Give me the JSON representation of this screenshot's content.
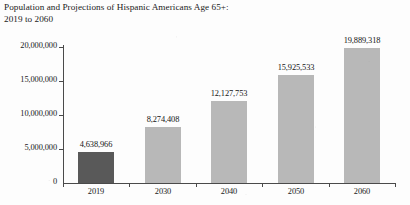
{
  "chart_data": {
    "type": "bar",
    "title": "Population and Projections of Hispanic Americans Age 65+:\n2019 to 2060",
    "title_line1": "Population and Projections of Hispanic Americans Age 65+:",
    "title_line2": "2019 to 2060",
    "xlabel": "",
    "ylabel": "",
    "categories": [
      "2019",
      "2030",
      "2040",
      "2050",
      "2060"
    ],
    "values": [
      4638966,
      8274408,
      12127753,
      15925533,
      19889318
    ],
    "value_labels": [
      "4,638,966",
      "8,274,408",
      "12,127,753",
      "15,925,533",
      "19,889,318"
    ],
    "bar_colors": [
      "#595959",
      "#b8b8b8",
      "#b8b8b8",
      "#b8b8b8",
      "#b8b8b8"
    ],
    "ylim": [
      0,
      20000000
    ],
    "yticks": [
      0,
      5000000,
      10000000,
      15000000,
      20000000
    ],
    "ytick_labels": [
      "0",
      "5,000,000",
      "10,000,000",
      "15,000,000",
      "20,000,000"
    ],
    "grid": false,
    "legend": null,
    "legend_position": "none",
    "axis_color": "#4a4a4a",
    "background_color": "#fdfdfd"
  }
}
